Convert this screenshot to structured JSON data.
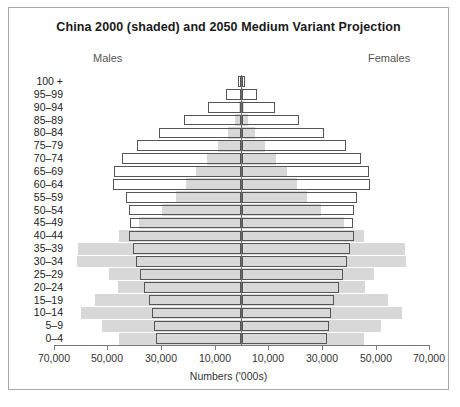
{
  "chart_data": {
    "type": "bar",
    "chart_subtype": "population-pyramid",
    "title": "China 2000 (shaded) and 2050 Medium Variant Projection",
    "xlabel": "Numbers ('000s)",
    "ylabel": "",
    "left_group_label": "Males",
    "right_group_label": "Females",
    "grid": false,
    "legend_position": "none",
    "x_unit": "thousands",
    "xlim": [
      -80000,
      80000
    ],
    "x_ticks": [
      70000,
      50000,
      30000,
      10000,
      10000,
      30000,
      50000,
      70000
    ],
    "x_tick_labels": [
      "70,000",
      "50,000",
      "30,000",
      "10,000",
      "10,000",
      "30,000",
      "50,000",
      "70,000"
    ],
    "x_tick_px": [
      54,
      107,
      161,
      215,
      268,
      322,
      376,
      429
    ],
    "center_px": 241.5,
    "px_per_unit": 0.002681,
    "categories": [
      "100 +",
      "95–99",
      "90–94",
      "85–89",
      "80–84",
      "75–79",
      "70–74",
      "65–69",
      "60–64",
      "55–59",
      "50–54",
      "45–49",
      "40–44",
      "35–39",
      "30–34",
      "25–29",
      "20–24",
      "15–19",
      "10–14",
      "5–9",
      "0–4"
    ],
    "series": [
      {
        "name": "China 2000 (shaded)",
        "style": "shaded",
        "color": "#d8d8d8",
        "males": [
          60,
          260,
          900,
          2600,
          5200,
          8600,
          12800,
          17000,
          20600,
          24400,
          29800,
          38200,
          45800,
          61000,
          61200,
          49600,
          46200,
          54600,
          60000,
          52000,
          45600
        ],
        "females": [
          60,
          260,
          900,
          2600,
          5200,
          8600,
          12800,
          17000,
          20600,
          24400,
          29800,
          38200,
          45800,
          61000,
          61200,
          49600,
          46200,
          54600,
          60000,
          52000,
          45600
        ]
      },
      {
        "name": "2050 Medium Variant Projection",
        "style": "outline",
        "color": "#555555",
        "males": [
          1400,
          5600,
          12400,
          21400,
          30800,
          39000,
          44600,
          47600,
          47800,
          43200,
          42000,
          41600,
          41800,
          40600,
          39400,
          38000,
          36200,
          34400,
          33200,
          32600,
          31800
        ],
        "females": [
          1400,
          5600,
          12400,
          21400,
          30800,
          39000,
          44600,
          47600,
          47800,
          43200,
          42000,
          41600,
          41800,
          40600,
          39400,
          38000,
          36200,
          34400,
          33200,
          32600,
          31800
        ]
      }
    ]
  }
}
